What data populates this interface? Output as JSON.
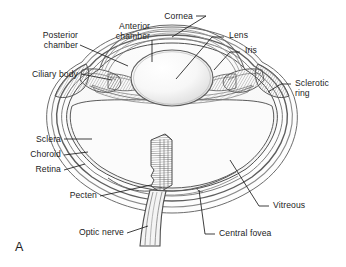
{
  "figure": {
    "panel_label": "A",
    "background_color": "#ffffff",
    "line_color": "#4a4a4a",
    "text_color": "#1c1c1c"
  },
  "labels": [
    {
      "id": "posterior-chamber",
      "text_line1": "Posterior",
      "text_line2": "chamber",
      "align": "right",
      "x": 78,
      "y": 32
    },
    {
      "id": "anterior-chamber",
      "text_line1": "Anterior",
      "text_line2": "chamber",
      "align": "right",
      "x": 150,
      "y": 24
    },
    {
      "id": "cornea",
      "text_line1": "Cornea",
      "text_line2": "",
      "align": "right",
      "x": 193,
      "y": 14
    },
    {
      "id": "lens",
      "text_line1": "Lens",
      "text_line2": "",
      "align": "left",
      "x": 228,
      "y": 33
    },
    {
      "id": "iris",
      "text_line1": "Iris",
      "text_line2": "",
      "align": "left",
      "x": 244,
      "y": 48
    },
    {
      "id": "sclerotic-ring",
      "text_line1": "Sclerotic",
      "text_line2": "ring",
      "align": "left",
      "x": 294,
      "y": 87
    },
    {
      "id": "ciliary-body",
      "text_line1": "Ciliary body",
      "text_line2": "",
      "align": "right",
      "x": 78,
      "y": 70
    },
    {
      "id": "sclera",
      "text_line1": "Sclera",
      "text_line2": "",
      "align": "right",
      "x": 61,
      "y": 135
    },
    {
      "id": "choroid",
      "text_line1": "Choroid",
      "text_line2": "",
      "align": "right",
      "x": 61,
      "y": 150
    },
    {
      "id": "retina",
      "text_line1": "Retina",
      "text_line2": "",
      "align": "right",
      "x": 61,
      "y": 166
    },
    {
      "id": "pecten",
      "text_line1": "Pecten",
      "text_line2": "",
      "align": "right",
      "x": 97,
      "y": 192
    },
    {
      "id": "optic-nerve",
      "text_line1": "Optic nerve",
      "text_line2": "",
      "align": "right",
      "x": 124,
      "y": 229
    },
    {
      "id": "vitreous",
      "text_line1": "Vitreous",
      "text_line2": "",
      "align": "left",
      "x": 272,
      "y": 203
    },
    {
      "id": "central-fovea",
      "text_line1": "Central fovea",
      "text_line2": "",
      "align": "left",
      "x": 218,
      "y": 231
    }
  ]
}
